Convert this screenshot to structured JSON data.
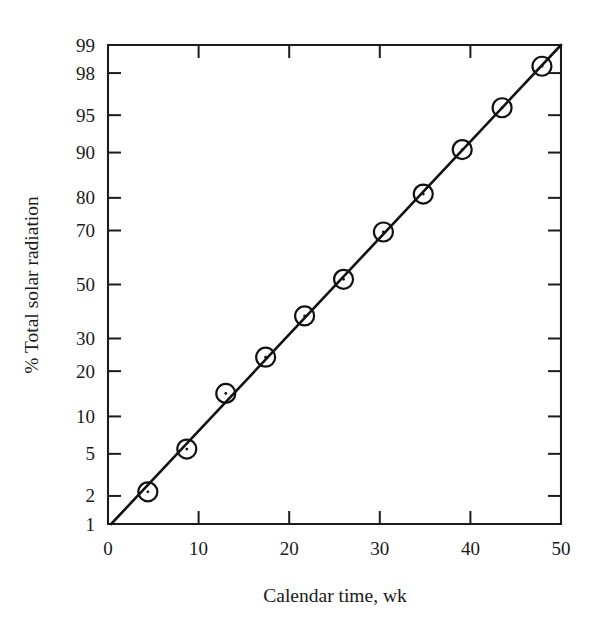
{
  "figure": {
    "background_color": "#ffffff",
    "ink_color": "#1a1a1a"
  },
  "chart_data": {
    "type": "scatter",
    "title": "",
    "subtitle": "",
    "xlabel": "Calendar time, wk",
    "ylabel": "% Total solar radiation",
    "x_scale": "linear",
    "y_scale": "normal-probability",
    "xlim": [
      0,
      50
    ],
    "ylim": [
      1,
      99
    ],
    "grid": false,
    "legend": false,
    "legend_position": "none",
    "x_ticks": [
      0,
      10,
      20,
      30,
      40,
      50
    ],
    "x_tick_labels": [
      "0",
      "10",
      "20",
      "30",
      "40",
      "50"
    ],
    "y_ticks": [
      1,
      2,
      5,
      10,
      20,
      30,
      50,
      70,
      80,
      90,
      95,
      98,
      99
    ],
    "y_tick_labels": [
      "1",
      "2",
      "5",
      "10",
      "20",
      "30",
      "50",
      "70",
      "80",
      "90",
      "95",
      "98",
      "99"
    ],
    "marker_style": "circle-with-center-dot",
    "series": [
      {
        "name": "Cumulative total solar radiation",
        "x": [
          4.4,
          8.7,
          13.0,
          17.4,
          21.7,
          26.0,
          30.4,
          34.8,
          39.1,
          43.5,
          47.9
        ],
        "values": [
          2.2,
          5.5,
          14.5,
          24.0,
          38.0,
          52.0,
          69.5,
          81.0,
          90.5,
          95.7,
          98.3
        ]
      }
    ],
    "fit_line": {
      "name": "Straight-line fit",
      "x_endpoints": [
        0.35,
        50.0
      ],
      "y_endpoints": [
        1.0,
        99.0
      ]
    },
    "annotations": []
  }
}
